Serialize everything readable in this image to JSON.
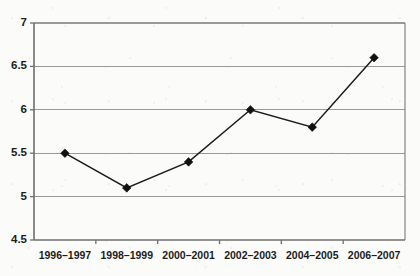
{
  "chart_data": {
    "type": "line",
    "title": "",
    "subtitle": "",
    "xlabel": "",
    "ylabel": "",
    "categories": [
      "1996–1997",
      "1998–1999",
      "2000–2001",
      "2002–2003",
      "2004–2005",
      "2006–2007"
    ],
    "values": [
      5.5,
      5.1,
      5.4,
      6.0,
      5.8,
      6.6
    ],
    "series": [
      {
        "name": "",
        "values": [
          5.5,
          5.1,
          5.4,
          6.0,
          5.8,
          6.6
        ]
      }
    ],
    "ylim": [
      4.5,
      7
    ],
    "ytick_labels": [
      "7",
      "6.5",
      "6",
      "5.5",
      "5",
      "4.5"
    ],
    "ytick_values": [
      7,
      6.5,
      6,
      5.5,
      5,
      4.5
    ],
    "ytick_step": 0.5,
    "grid": "horizontal",
    "legend": "none",
    "marker": "diamond",
    "line_color": "#111111",
    "grid_color": "#9a9a9a",
    "axis_color": "#6f6f6f",
    "background_color": "#fbfbf9"
  }
}
